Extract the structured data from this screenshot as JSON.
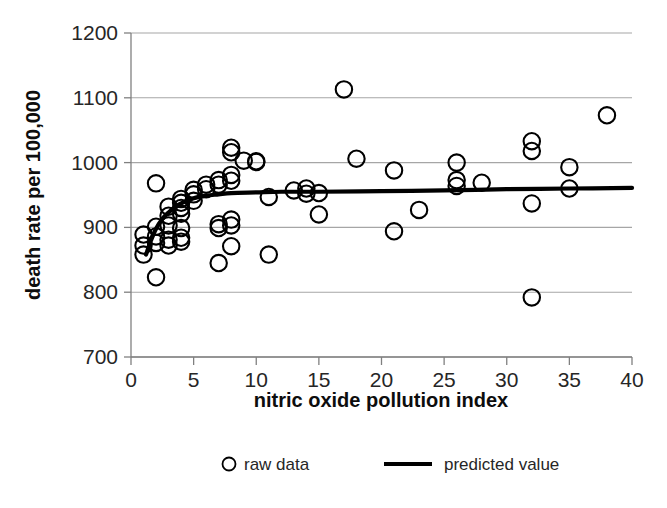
{
  "chart_data": {
    "type": "scatter",
    "title": "",
    "xlabel": "nitric oxide pollution index",
    "ylabel": "death rate per 100,000",
    "xlim": [
      0,
      40
    ],
    "ylim": [
      700,
      1200
    ],
    "xticks": [
      0,
      5,
      10,
      15,
      20,
      25,
      30,
      35,
      40
    ],
    "yticks": [
      700,
      800,
      900,
      1000,
      1100,
      1200
    ],
    "xtick_labels": [
      "0",
      "5",
      "10",
      "15",
      "20",
      "25",
      "30",
      "35",
      "40"
    ],
    "ytick_labels": [
      "700",
      "800",
      "900",
      "1000",
      "1100",
      "1200"
    ],
    "grid": "horizontal",
    "legend_position": "bottom",
    "series": [
      {
        "name": "raw data",
        "type": "scatter",
        "marker": "open-circle",
        "color": "#000000",
        "points": [
          [
            1,
            889
          ],
          [
            1,
            872
          ],
          [
            1,
            858
          ],
          [
            2,
            968
          ],
          [
            2,
            901
          ],
          [
            2,
            886
          ],
          [
            2,
            876
          ],
          [
            2,
            823
          ],
          [
            3,
            932
          ],
          [
            3,
            918
          ],
          [
            3,
            903
          ],
          [
            3,
            881
          ],
          [
            3,
            872
          ],
          [
            4,
            944
          ],
          [
            4,
            938
          ],
          [
            4,
            930
          ],
          [
            4,
            921
          ],
          [
            4,
            899
          ],
          [
            4,
            884
          ],
          [
            4,
            878
          ],
          [
            5,
            958
          ],
          [
            5,
            951
          ],
          [
            5,
            941
          ],
          [
            6,
            966
          ],
          [
            6,
            959
          ],
          [
            7,
            973
          ],
          [
            7,
            966
          ],
          [
            7,
            905
          ],
          [
            7,
            899
          ],
          [
            7,
            845
          ],
          [
            8,
            1023
          ],
          [
            8,
            1016
          ],
          [
            8,
            981
          ],
          [
            8,
            972
          ],
          [
            8,
            912
          ],
          [
            8,
            903
          ],
          [
            8,
            871
          ],
          [
            9,
            1003
          ],
          [
            10,
            1001
          ],
          [
            10,
            1002
          ],
          [
            11,
            947
          ],
          [
            11,
            858
          ],
          [
            13,
            957
          ],
          [
            14,
            960
          ],
          [
            14,
            952
          ],
          [
            15,
            953
          ],
          [
            15,
            920
          ],
          [
            17,
            1113
          ],
          [
            18,
            1006
          ],
          [
            21,
            988
          ],
          [
            21,
            894
          ],
          [
            23,
            927
          ],
          [
            26,
            1000
          ],
          [
            26,
            973
          ],
          [
            26,
            964
          ],
          [
            28,
            969
          ],
          [
            32,
            1033
          ],
          [
            32,
            1018
          ],
          [
            32,
            937
          ],
          [
            32,
            792
          ],
          [
            35,
            993
          ],
          [
            35,
            960
          ],
          [
            38,
            1073
          ]
        ]
      },
      {
        "name": "predicted value",
        "type": "line",
        "color": "#000000",
        "points": [
          [
            1.2,
            858
          ],
          [
            1.6,
            880
          ],
          [
            2.0,
            898
          ],
          [
            2.5,
            913
          ],
          [
            3.0,
            923
          ],
          [
            3.5,
            931
          ],
          [
            4.0,
            937
          ],
          [
            5.0,
            945
          ],
          [
            6.0,
            949
          ],
          [
            7.0,
            951
          ],
          [
            8.0,
            953
          ],
          [
            10.0,
            954
          ],
          [
            12.0,
            955
          ],
          [
            15.0,
            955
          ],
          [
            20.0,
            956
          ],
          [
            25.0,
            957
          ],
          [
            30.0,
            959
          ],
          [
            35.0,
            960
          ],
          [
            40.0,
            961
          ]
        ]
      }
    ]
  },
  "legend": {
    "entries": [
      {
        "label": "raw data",
        "symbol": "open-circle"
      },
      {
        "label": "predicted value",
        "symbol": "line"
      }
    ]
  },
  "colors": {
    "marker": "#000000",
    "curve": "#000000",
    "gridline": "#a6a6a6",
    "axis": "#808080",
    "text": "#262626",
    "background": "#ffffff"
  }
}
